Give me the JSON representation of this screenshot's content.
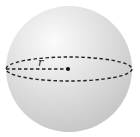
{
  "diagram": {
    "type": "sphere",
    "labels": {
      "radius": "r"
    },
    "colors": {
      "sphere_highlight": "#f7f7f7",
      "sphere_mid": "#dedede",
      "sphere_edge": "#c2c2c2",
      "dash_stroke": "#222222",
      "center_dot": "#111111"
    }
  }
}
